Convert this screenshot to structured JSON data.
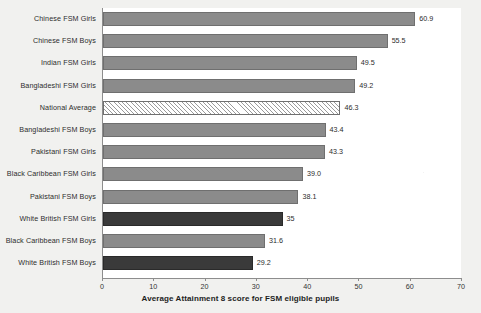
{
  "chart_data": {
    "type": "bar",
    "orientation": "horizontal",
    "title": "",
    "xlabel": "Average Attainment 8 score for FSM eligible pupils",
    "ylabel": "",
    "xlim": [
      0,
      70
    ],
    "xticks": [
      0,
      10,
      20,
      30,
      40,
      50,
      60,
      70
    ],
    "xtick_labels": [
      "0",
      "10",
      "20",
      "30",
      "40",
      "50",
      "60",
      "70"
    ],
    "grid": false,
    "legend": "none",
    "categories": [
      "Chinese FSM Girls",
      "Chinese FSM Boys",
      "Indian FSM Girls",
      "Bangladeshi FSM Girls",
      "National Average",
      "Bangladeshi FSM Boys",
      "Pakistani FSM Girls",
      "Black Caribbean FSM Girls",
      "Pakistani FSM Boys",
      "White British FSM Girls",
      "Black Caribbean FSM Boys",
      "White British FSM Boys"
    ],
    "values": [
      60.9,
      55.5,
      49.5,
      49.2,
      46.3,
      43.4,
      43.3,
      39.0,
      38.1,
      35,
      31.6,
      29.2
    ],
    "value_labels": [
      "60.9",
      "55.5",
      "49.5",
      "49.2",
      "46.3",
      "43.4",
      "43.3",
      "39.0",
      "38.1",
      "35",
      "31.6",
      "29.2"
    ],
    "bar_styles": [
      "grey",
      "grey",
      "grey",
      "grey",
      "hatch",
      "grey",
      "grey",
      "grey",
      "grey",
      "dark",
      "grey",
      "dark"
    ],
    "colors": {
      "grey": "#8b8b8b",
      "dark": "#3a3a3a",
      "hatch": "#f7f7f7",
      "bar_outline": "#6f6f6f",
      "axis": "#8d8d8d",
      "text": "#2d2d2d",
      "background": "#f1f1ef",
      "plot_background": "#ffffff"
    }
  }
}
